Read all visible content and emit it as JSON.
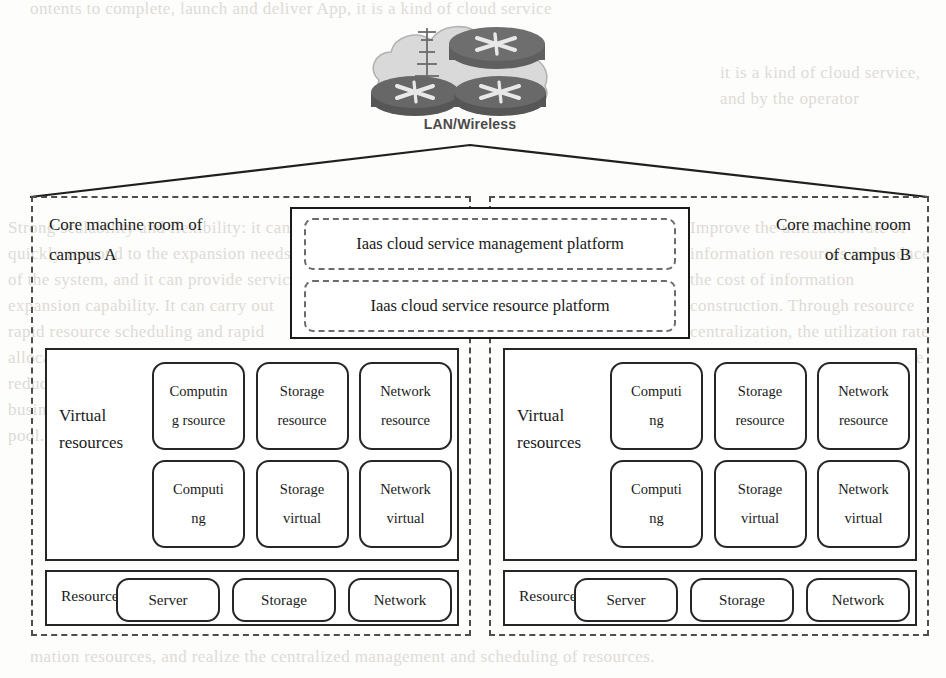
{
  "diagram": {
    "cloud": {
      "label": "LAN/Wireless",
      "icon": "network-cloud-icon",
      "router_count": 3,
      "antenna": true
    },
    "platform": {
      "items": [
        {
          "label": "Iaas cloud service management platform",
          "name": "iaas-management-platform"
        },
        {
          "label": "Iaas cloud service resource platform",
          "name": "iaas-resource-platform"
        }
      ]
    },
    "campuses": [
      {
        "id": "campus-a",
        "title": "Core machine room of campus A",
        "title_lines": [
          "Core machine room of",
          "campus A"
        ],
        "align": "left",
        "virtual": {
          "label": "Virtual resources",
          "label_lines": [
            "Virtual",
            "resources"
          ],
          "rows": [
            [
              {
                "lines": [
                  "Computin",
                  "g rsource"
                ],
                "name": "computing-resource-box"
              },
              {
                "lines": [
                  "Storage",
                  "resource"
                ],
                "name": "storage-resource-box"
              },
              {
                "lines": [
                  "Network",
                  "resource"
                ],
                "name": "network-resource-box"
              }
            ],
            [
              {
                "lines": [
                  "Computi",
                  "ng"
                ],
                "name": "computing-virtual-box"
              },
              {
                "lines": [
                  "Storage",
                  "virtual"
                ],
                "name": "storage-virtual-box"
              },
              {
                "lines": [
                  "Network",
                  "virtual"
                ],
                "name": "network-virtual-box"
              }
            ]
          ]
        },
        "physical": {
          "label": "Resource",
          "items": [
            {
              "label": "Server",
              "name": "server-box"
            },
            {
              "label": "Storage",
              "name": "storage-box"
            },
            {
              "label": "Network",
              "name": "network-box"
            }
          ]
        }
      },
      {
        "id": "campus-b",
        "title": "Core machine room of campus B",
        "title_lines": [
          "Core machine room",
          "of campus B"
        ],
        "align": "right",
        "virtual": {
          "label": "Virtual resources",
          "label_lines": [
            "Virtual",
            "resources"
          ],
          "rows": [
            [
              {
                "lines": [
                  "Computi",
                  "ng"
                ],
                "name": "computing-resource-box"
              },
              {
                "lines": [
                  "Storage",
                  "resource"
                ],
                "name": "storage-resource-box"
              },
              {
                "lines": [
                  "Network",
                  "resource"
                ],
                "name": "network-resource-box"
              }
            ],
            [
              {
                "lines": [
                  "Computi",
                  "ng"
                ],
                "name": "computing-virtual-box"
              },
              {
                "lines": [
                  "Storage",
                  "virtual"
                ],
                "name": "storage-virtual-box"
              },
              {
                "lines": [
                  "Network",
                  "virtual"
                ],
                "name": "network-virtual-box"
              }
            ]
          ]
        },
        "physical": {
          "label": "Resource",
          "items": [
            {
              "label": "Server",
              "name": "server-box"
            },
            {
              "label": "Storage",
              "name": "storage-box"
            },
            {
              "label": "Network",
              "name": "network-box"
            }
          ]
        }
      }
    ],
    "colors": {
      "line": "#262626",
      "dashed": "#4d4d4d",
      "cloud_fill": "#cfcfcf",
      "router_fill": "#6e6e6e",
      "text": "#1a1a1a",
      "bleed_text": "#dddbd6"
    },
    "background_bleed": {
      "top": "ontents to complete, launch and deliver App, it is a kind of cloud service",
      "left": "Strong scalability and flexibility: it can quickly respond to the expansion needs of the system, and it can provide service expansion capability. It can carry out rapid resource scheduling and rapid allocation of resources on demand, reducing the service response time of business, making it a sliding resource pool.",
      "right": "Improve the utilization rate of information resources and reduce the cost of information construction. Through resource centralization, the utilization rate of hardware and software can be improved.",
      "mid": "it is a kind of cloud service, and by the operator",
      "bottom": "mation resources, and realize the centralized management and scheduling of resources."
    }
  }
}
